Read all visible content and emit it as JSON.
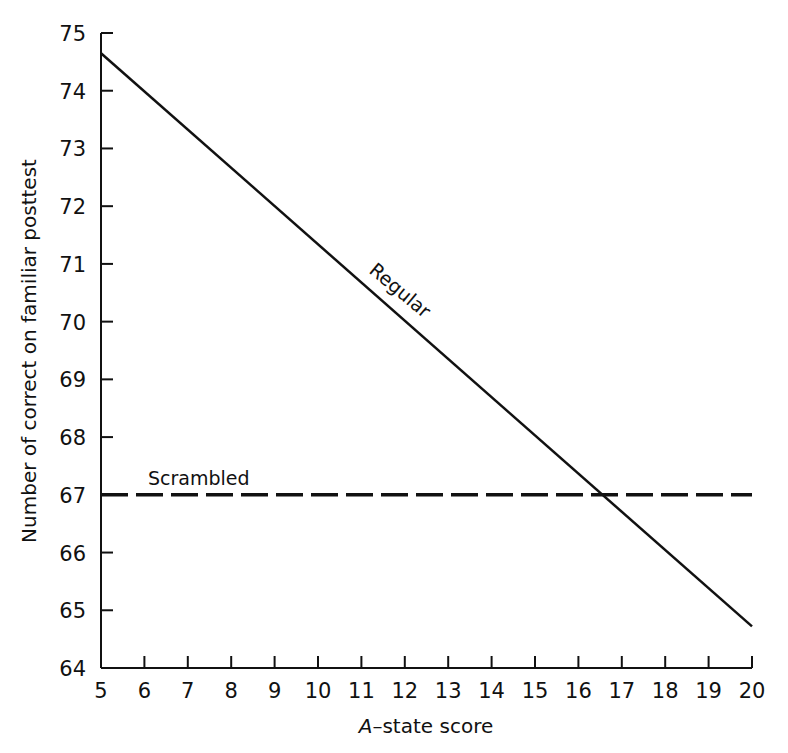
{
  "chart_data": {
    "type": "line",
    "title": "",
    "xlabel": "A-state score",
    "xlabel_italic_prefix": "A",
    "xlabel_rest": "–state score",
    "ylabel": "Number of correct on familiar posttest",
    "xlim": [
      5,
      20
    ],
    "ylim": [
      64,
      75
    ],
    "grid": false,
    "legend": "inline labels",
    "x_ticks": [
      5,
      6,
      7,
      8,
      9,
      10,
      11,
      12,
      13,
      14,
      15,
      16,
      17,
      18,
      19,
      20
    ],
    "y_ticks": [
      64,
      65,
      66,
      67,
      68,
      69,
      70,
      71,
      72,
      73,
      74,
      75
    ],
    "series": [
      {
        "name": "Regular",
        "style": "solid",
        "x": [
          5,
          20
        ],
        "values": [
          74.65,
          64.72
        ]
      },
      {
        "name": "Scrambled",
        "style": "dashed",
        "x": [
          5,
          20
        ],
        "values": [
          67.0,
          67.0
        ]
      }
    ],
    "annotations": [
      {
        "text": "Regular",
        "near_x": 12.3,
        "near_y": 70.6,
        "rotation": 40
      },
      {
        "text": "Scrambled",
        "near_x": 6.2,
        "near_y": 67.3
      }
    ],
    "intersection": {
      "x": 16.5,
      "y": 67.0
    },
    "colors": {
      "line": "#111111",
      "background": "#ffffff"
    }
  }
}
